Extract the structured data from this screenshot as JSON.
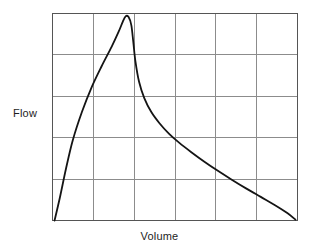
{
  "figure": {
    "background_color": "#ffffff",
    "title": ""
  },
  "axes": {
    "ylabel": "Flow",
    "xlabel": "Volume"
  },
  "chart_data": {
    "type": "line",
    "title": "",
    "subtitle": "",
    "xlabel": "Volume",
    "ylabel": "Flow",
    "xlim": [
      0,
      6
    ],
    "ylim": [
      0,
      5
    ],
    "grid": true,
    "grid_color": "#8c8c8c",
    "x_gridlines": [
      0,
      1,
      2,
      3,
      4,
      5,
      6
    ],
    "y_gridlines": [
      0,
      1,
      2,
      3,
      4,
      5
    ],
    "xticklabels": [],
    "yticklabels": [],
    "legend": null,
    "legend_position": "none",
    "annotations": [],
    "series": [
      {
        "name": "Expiratory flow-volume curve",
        "color": "#141414",
        "linewidth": 1.8,
        "points": [
          [
            0.05,
            0.0
          ],
          [
            0.18,
            0.55
          ],
          [
            0.33,
            1.25
          ],
          [
            0.5,
            1.95
          ],
          [
            0.72,
            2.62
          ],
          [
            0.95,
            3.2
          ],
          [
            1.2,
            3.72
          ],
          [
            1.45,
            4.2
          ],
          [
            1.62,
            4.56
          ],
          [
            1.72,
            4.8
          ],
          [
            1.79,
            4.93
          ],
          [
            1.86,
            4.92
          ],
          [
            1.93,
            4.72
          ],
          [
            1.98,
            4.3
          ],
          [
            2.03,
            3.85
          ],
          [
            2.12,
            3.35
          ],
          [
            2.25,
            2.95
          ],
          [
            2.42,
            2.62
          ],
          [
            2.62,
            2.35
          ],
          [
            2.85,
            2.1
          ],
          [
            3.1,
            1.88
          ],
          [
            3.4,
            1.65
          ],
          [
            3.72,
            1.42
          ],
          [
            4.05,
            1.2
          ],
          [
            4.4,
            0.98
          ],
          [
            4.75,
            0.77
          ],
          [
            5.1,
            0.57
          ],
          [
            5.45,
            0.37
          ],
          [
            5.75,
            0.18
          ],
          [
            5.95,
            0.02
          ]
        ]
      }
    ]
  }
}
